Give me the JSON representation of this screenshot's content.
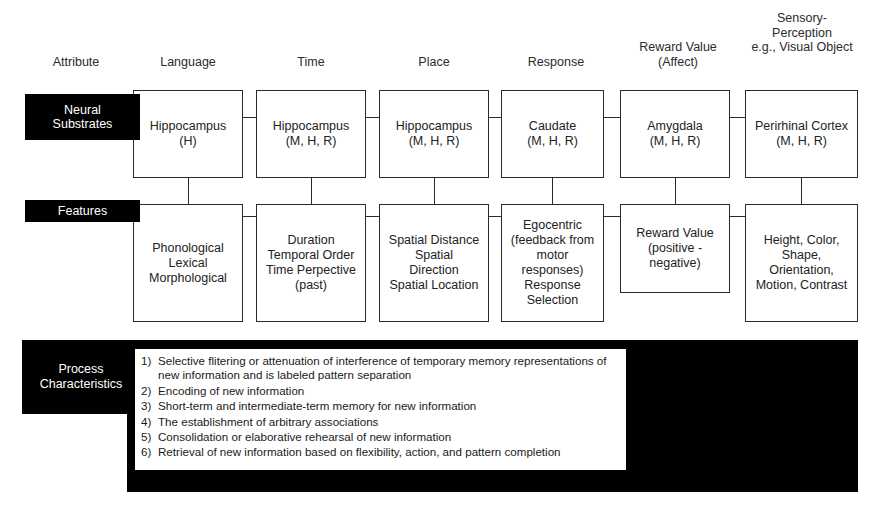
{
  "columns": [
    {
      "key": "attribute",
      "header": "Attribute"
    },
    {
      "key": "language",
      "header": "Language"
    },
    {
      "key": "time",
      "header": "Time"
    },
    {
      "key": "place",
      "header": "Place"
    },
    {
      "key": "response",
      "header": "Response"
    },
    {
      "key": "reward",
      "header": "Reward Value\n(Affect)"
    },
    {
      "key": "sensory",
      "header": "Sensory-\nPerception\ne.g., Visual Object"
    }
  ],
  "rows": {
    "neural_substrates": {
      "label": "Neural\nSubstrates",
      "cells": [
        "Hippocampus\n(H)",
        "Hippocampus\n(M, H, R)",
        "Hippocampus\n(M, H, R)",
        "Caudate\n(M, H, R)",
        "Amygdala\n(M, H, R)",
        "Perirhinal Cortex\n(M, H, R)"
      ]
    },
    "features": {
      "label": "Features",
      "cells": [
        "Phonological\nLexical\nMorphological",
        "Duration\nTemporal Order\nTime Perpective\n(past)",
        "Spatial Distance\nSpatial\nDirection\nSpatial Location",
        "Egocentric\n(feedback from\nmotor\nresponses)\nResponse\nSelection",
        "Reward Value\n(positive -\nnegative)",
        "Height, Color,\nShape,\nOrientation,\nMotion, Contrast"
      ]
    },
    "process_characteristics": {
      "label": "Process\nCharacteristics",
      "items": [
        {
          "num": "1)",
          "text": "Selective flitering or attenuation of interference of temporary memory representations of new information and is labeled pattern separation"
        },
        {
          "num": "2)",
          "text": "Encoding of new information"
        },
        {
          "num": "3)",
          "text": "Short-term and intermediate-term memory for new information"
        },
        {
          "num": "4)",
          "text": "The establishment of arbitrary associations"
        },
        {
          "num": "5)",
          "text": "Consolidation or elaborative rehearsal of new information"
        },
        {
          "num": "6)",
          "text": "Retrieval of new information based on flexibility, action, and pattern completion"
        }
      ]
    }
  },
  "colors": {
    "background": "#ffffff",
    "label_bar": "#000000",
    "label_text": "#ffffff",
    "box_border": "#2a2a2a",
    "body_text": "#1a1a1a"
  }
}
